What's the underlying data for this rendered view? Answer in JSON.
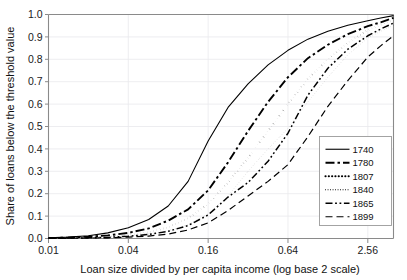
{
  "chart_data": {
    "type": "line",
    "title": "",
    "xlabel": "Loan size divided by per capita income (log base 2 scale)",
    "ylabel": "Share of loans below the threshold value",
    "x_scale": "log2",
    "xlim": [
      0.01,
      4.0
    ],
    "ylim": [
      0.0,
      1.0
    ],
    "grid": true,
    "legend_position": "right-inside",
    "xticks": [
      0.01,
      0.04,
      0.16,
      0.64,
      2.56
    ],
    "xtick_labels": [
      "0.01",
      "0.04",
      "0.16",
      "0.64",
      "2.56"
    ],
    "yticks": [
      0.0,
      0.1,
      0.2,
      0.3,
      0.4,
      0.5,
      0.6,
      0.7,
      0.8,
      0.9,
      1.0
    ],
    "ytick_labels": [
      "0.0",
      "0.1",
      "0.2",
      "0.3",
      "0.4",
      "0.5",
      "0.6",
      "0.7",
      "0.8",
      "0.9",
      "1.0"
    ],
    "x": [
      0.01,
      0.014,
      0.02,
      0.028,
      0.04,
      0.057,
      0.08,
      0.113,
      0.16,
      0.226,
      0.32,
      0.453,
      0.64,
      0.905,
      1.28,
      1.81,
      2.56,
      3.2,
      4.0
    ],
    "series": [
      {
        "name": "1740",
        "dash": "solid",
        "width": 1.1,
        "values": [
          0.003,
          0.006,
          0.012,
          0.025,
          0.048,
          0.085,
          0.145,
          0.255,
          0.435,
          0.585,
          0.69,
          0.775,
          0.84,
          0.89,
          0.925,
          0.952,
          0.972,
          0.984,
          0.995
        ]
      },
      {
        "name": "1780",
        "dash": "dashdot",
        "width": 1.9,
        "values": [
          0.002,
          0.004,
          0.008,
          0.014,
          0.025,
          0.045,
          0.08,
          0.13,
          0.215,
          0.34,
          0.48,
          0.61,
          0.72,
          0.805,
          0.865,
          0.912,
          0.948,
          0.965,
          0.985
        ]
      },
      {
        "name": "1807",
        "dash": "dotted-thick",
        "width": 2.1,
        "values": [
          0.001,
          0.002,
          0.004,
          0.008,
          0.014,
          0.028,
          0.05,
          0.09,
          0.155,
          0.25,
          0.36,
          0.48,
          0.6,
          0.712,
          0.8,
          0.875,
          0.93,
          0.955,
          0.975
        ]
      },
      {
        "name": "1840",
        "dash": "dotted-fine",
        "width": 1.0,
        "values": [
          0.001,
          0.002,
          0.003,
          0.006,
          0.011,
          0.02,
          0.035,
          0.062,
          0.11,
          0.19,
          0.3,
          0.4,
          0.492,
          0.61,
          0.72,
          0.82,
          0.895,
          0.925,
          0.952
        ]
      },
      {
        "name": "1865",
        "dash": "dashdotdot",
        "width": 1.5,
        "values": [
          0.001,
          0.002,
          0.003,
          0.005,
          0.01,
          0.018,
          0.032,
          0.058,
          0.105,
          0.185,
          0.25,
          0.345,
          0.47,
          0.64,
          0.76,
          0.845,
          0.905,
          0.935,
          0.962
        ]
      },
      {
        "name": "1899",
        "dash": "dashed",
        "width": 1.2,
        "values": [
          0.0,
          0.001,
          0.002,
          0.003,
          0.006,
          0.011,
          0.02,
          0.038,
          0.07,
          0.125,
          0.19,
          0.255,
          0.33,
          0.455,
          0.59,
          0.705,
          0.81,
          0.86,
          0.905
        ]
      }
    ]
  },
  "legend": {
    "items": [
      {
        "label": "1740"
      },
      {
        "label": "1780"
      },
      {
        "label": "1807"
      },
      {
        "label": "1840"
      },
      {
        "label": "1865"
      },
      {
        "label": "1899"
      }
    ]
  }
}
